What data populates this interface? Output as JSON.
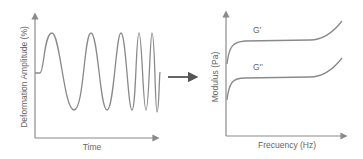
{
  "left_panel": {
    "ylabel": "Deformation Amplitude (%)",
    "xlabel": "Time",
    "description": "Sinusoidal deformation with increasing frequency (chirp)"
  },
  "arrow": {
    "icon": "right-arrow-icon"
  },
  "right_panel": {
    "ylabel": "Modulus (Pa)",
    "xlabel": "Frecuency (Hz)",
    "series": [
      {
        "name": "G'",
        "label": "G'"
      },
      {
        "name": "G''",
        "label": "G''"
      }
    ]
  },
  "colors": {
    "line": "#8a8a8a",
    "axis": "#8a8a8a",
    "text": "#666666",
    "arrow": "#555555"
  }
}
